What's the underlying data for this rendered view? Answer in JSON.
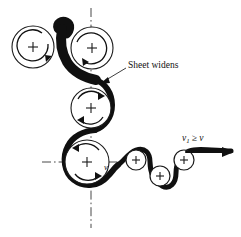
{
  "figure": {
    "background_color": "#ffffff",
    "ink_color": "#101010",
    "labels": {
      "sheet_widens": "Sheet widens",
      "exit_velocity_main": "v",
      "exit_velocity_sub": "1",
      "exit_velocity_relation": "≥",
      "exit_velocity_ref": "v",
      "roller_velocity": "v"
    },
    "rollers": [
      {
        "name": "top-left-roller",
        "cx": 33,
        "cy": 47,
        "r": 21,
        "center_mark": "+",
        "rotation": "clockwise",
        "size": "large"
      },
      {
        "name": "top-right-roller",
        "cx": 92,
        "cy": 48,
        "r": 21,
        "center_mark": "+",
        "rotation": "clockwise",
        "size": "large"
      },
      {
        "name": "middle-roller",
        "cx": 91,
        "cy": 108,
        "r": 20,
        "center_mark": "+",
        "rotation": "counterclockwise",
        "size": "large"
      },
      {
        "name": "bottom-left-roller",
        "cx": 87,
        "cy": 162,
        "r": 22,
        "center_mark": "+",
        "rotation": "counterclockwise",
        "size": "large"
      },
      {
        "name": "small-roller-1",
        "cx": 136,
        "cy": 160,
        "r": 10,
        "center_mark": "+",
        "rotation": "none",
        "size": "small"
      },
      {
        "name": "small-roller-2",
        "cx": 160,
        "cy": 176,
        "r": 10,
        "center_mark": "+",
        "rotation": "none",
        "size": "small"
      },
      {
        "name": "small-roller-3",
        "cx": 184,
        "cy": 160,
        "r": 10,
        "center_mark": "+",
        "rotation": "none",
        "size": "small"
      }
    ],
    "centerlines": [
      {
        "name": "vertical-centerline",
        "orientation": "vertical",
        "x": 91,
        "y1": 8,
        "y2": 228,
        "style": "dash-dot"
      },
      {
        "name": "horizontal-centerline",
        "orientation": "horizontal",
        "y": 162,
        "x1": 42,
        "x2": 122,
        "style": "dash-dot"
      }
    ],
    "annotations": [
      {
        "name": "sheet-widens-annotation",
        "text": "Sheet widens",
        "text_x": 128,
        "text_y": 65,
        "leader_from_x": 126,
        "leader_from_y": 68,
        "leader_to_x": 101,
        "leader_to_y": 83
      },
      {
        "name": "exit-velocity-annotation",
        "text_x": 182,
        "text_y": 140,
        "arrow_y": 152,
        "arrow_x1": 186,
        "arrow_x2": 232
      }
    ]
  }
}
